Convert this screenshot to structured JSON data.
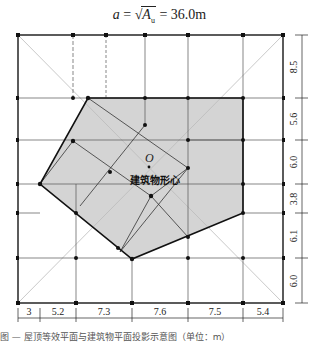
{
  "formula": {
    "lhs": "a",
    "eq1": " = ",
    "radicand": "A",
    "subscript": "u",
    "eq2": " = 36.0m"
  },
  "labels": {
    "origin": "O",
    "centroid": "建筑物形心"
  },
  "dimensions": {
    "bottom": [
      "3",
      "5.2",
      "7.3",
      "7.6",
      "7.5",
      "5.4"
    ],
    "right": [
      "8.5",
      "5.6",
      "6.0",
      "3.8",
      "6.1",
      "6.0"
    ]
  },
  "colors": {
    "fill": "#d4d4d4",
    "line": "#222222",
    "grid": "#555555",
    "diagonal": "#bbbbbb"
  },
  "caption": "图 — 屋顶等效平面与建筑物平面投影示意图（单位：m）"
}
